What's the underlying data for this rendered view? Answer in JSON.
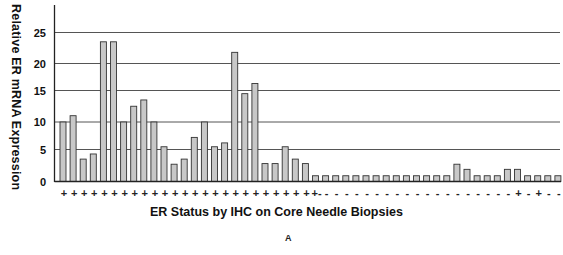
{
  "chart_data": {
    "type": "bar",
    "title": "",
    "xlabel": "ER Status by IHC on Core Needle Biopsies",
    "ylabel": "Relative ER mRNA Expression",
    "panel_label": "A",
    "ylim": [
      0,
      28
    ],
    "yticks": [
      0,
      5,
      10,
      15,
      20,
      25
    ],
    "grid": true,
    "legend": null,
    "bar_color": "#c8c8c8",
    "bar_edge_color": "#333333",
    "categories": [
      "+",
      "+",
      "+",
      "+",
      "+",
      "+",
      "+",
      "+",
      "+",
      "+",
      "+",
      "+",
      "+",
      "+",
      "+",
      "+",
      "+",
      "+",
      "+",
      "+",
      "+",
      "+",
      "+",
      "+",
      "+",
      "+-",
      "-",
      "-",
      "-",
      "-",
      "-",
      "-",
      "-",
      "-",
      "-",
      "-",
      "-",
      "-",
      "-",
      "-",
      "-",
      "-",
      "-",
      "-",
      "-",
      "+",
      "-",
      "+",
      "-",
      "-"
    ],
    "values": [
      10,
      11,
      3.5,
      4.3,
      23.5,
      23.5,
      10,
      12.5,
      13.5,
      10,
      5.5,
      2.7,
      3.5,
      7.2,
      10,
      5.5,
      6.2,
      21.8,
      14.5,
      16.3,
      2.8,
      2.8,
      5.5,
      3.5,
      2.8,
      0.9,
      0.9,
      0.9,
      0.9,
      0.9,
      0.9,
      0.9,
      0.9,
      0.9,
      0.9,
      0.9,
      0.9,
      0.9,
      0.9,
      2.7,
      1.9,
      0.9,
      0.9,
      0.9,
      1.9,
      1.9,
      0.9,
      0.9,
      0.9,
      0.9
    ]
  }
}
